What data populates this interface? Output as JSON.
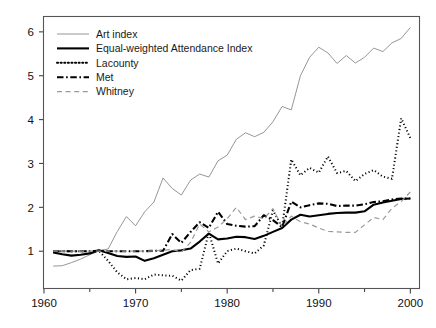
{
  "chart_data": {
    "type": "line",
    "title": "",
    "subtitle": "",
    "xlabel": "",
    "ylabel": "",
    "xlim": [
      1960,
      2001
    ],
    "ylim": [
      0.15,
      6.35
    ],
    "grid": false,
    "legend_position": "top-left",
    "x_ticks": [
      1960,
      1970,
      1980,
      1990,
      2000
    ],
    "x_tick_labels": [
      "1960",
      "1970",
      "1980",
      "1990",
      "2000"
    ],
    "x_minor_ticks": [
      1965,
      1975,
      1985,
      1995
    ],
    "y_ticks": [
      1,
      2,
      3,
      4,
      5,
      6
    ],
    "y_tick_labels": [
      "1",
      "2",
      "3",
      "4",
      "5",
      "6"
    ],
    "x": [
      1961,
      1962,
      1963,
      1964,
      1965,
      1966,
      1967,
      1968,
      1969,
      1970,
      1971,
      1972,
      1973,
      1974,
      1975,
      1976,
      1977,
      1978,
      1979,
      1980,
      1981,
      1982,
      1983,
      1984,
      1985,
      1986,
      1987,
      1988,
      1989,
      1990,
      1991,
      1992,
      1993,
      1994,
      1995,
      1996,
      1997,
      1998,
      1999,
      2000
    ],
    "series": [
      {
        "name": "Art index",
        "style": "solid",
        "color": "#8a8a8a",
        "width": 0.9,
        "values": [
          0.66,
          0.67,
          0.74,
          0.82,
          0.92,
          1.01,
          1.05,
          1.45,
          1.79,
          1.58,
          1.9,
          2.12,
          2.67,
          2.43,
          2.28,
          2.62,
          2.76,
          2.69,
          3.06,
          3.19,
          3.55,
          3.7,
          3.61,
          3.71,
          3.95,
          4.3,
          4.22,
          5.0,
          5.42,
          5.65,
          5.52,
          5.28,
          5.46,
          5.29,
          5.42,
          5.63,
          5.55,
          5.75,
          5.85,
          6.1
        ]
      },
      {
        "name": "Equal-weighted Attendance Index",
        "style": "solid",
        "color": "#000000",
        "width": 2.1,
        "values": [
          0.97,
          0.93,
          0.9,
          0.92,
          0.95,
          1.02,
          0.96,
          0.89,
          0.87,
          0.88,
          0.78,
          0.84,
          0.92,
          1.0,
          1.02,
          1.06,
          1.22,
          1.4,
          1.27,
          1.29,
          1.33,
          1.32,
          1.28,
          1.35,
          1.44,
          1.53,
          1.72,
          1.83,
          1.79,
          1.82,
          1.85,
          1.87,
          1.88,
          1.88,
          1.91,
          2.06,
          2.11,
          2.15,
          2.19,
          2.2
        ]
      },
      {
        "name": "Lacounty",
        "style": "dotted",
        "color": "#000000",
        "width": 2.0,
        "values": [
          0.99,
          1.0,
          1.0,
          1.0,
          1.0,
          1.01,
          0.78,
          0.52,
          0.36,
          0.39,
          0.36,
          0.47,
          0.45,
          0.44,
          0.33,
          0.57,
          0.6,
          1.43,
          0.72,
          1.0,
          1.06,
          1.0,
          0.95,
          1.13,
          1.93,
          1.55,
          3.09,
          2.73,
          2.9,
          2.79,
          3.16,
          2.78,
          2.83,
          2.6,
          2.76,
          2.85,
          2.7,
          2.65,
          4.03,
          3.58
        ]
      },
      {
        "name": "Met",
        "style": "dashdot",
        "color": "#000000",
        "width": 2.1,
        "values": [
          1.0,
          1.0,
          1.0,
          1.0,
          1.0,
          1.01,
          1.0,
          1.0,
          1.0,
          1.0,
          1.0,
          1.01,
          1.01,
          1.39,
          1.19,
          1.44,
          1.66,
          1.53,
          1.9,
          1.62,
          1.58,
          1.56,
          1.57,
          1.82,
          1.71,
          1.55,
          2.13,
          2.0,
          2.05,
          2.09,
          2.08,
          2.03,
          2.04,
          2.04,
          2.07,
          2.12,
          2.14,
          2.18,
          2.2,
          2.2
        ]
      },
      {
        "name": "Whitney",
        "style": "dashed",
        "color": "#9a9a9a",
        "width": 1.2,
        "values": [
          1.0,
          1.0,
          1.0,
          1.0,
          1.0,
          1.0,
          1.0,
          1.0,
          1.0,
          1.0,
          1.0,
          1.01,
          1.02,
          1.04,
          0.98,
          1.2,
          1.62,
          1.44,
          1.55,
          1.74,
          2.0,
          1.72,
          1.8,
          1.74,
          1.97,
          1.55,
          1.8,
          1.67,
          1.62,
          1.53,
          1.45,
          1.44,
          1.43,
          1.43,
          1.6,
          1.77,
          1.72,
          1.98,
          2.13,
          2.35
        ]
      }
    ]
  },
  "legend": {
    "entries": [
      {
        "label": "Art index"
      },
      {
        "label": "Equal-weighted Attendance Index"
      },
      {
        "label": "Lacounty"
      },
      {
        "label": "Met"
      },
      {
        "label": "Whitney"
      }
    ]
  },
  "axes": {
    "x_tick_labels": [
      "1960",
      "1970",
      "1980",
      "1990",
      "2000"
    ],
    "y_tick_labels": [
      "1",
      "2",
      "3",
      "4",
      "5",
      "6"
    ]
  },
  "colors": {
    "art_index": "#8a8a8a",
    "equal_weighted": "#000000",
    "lacounty": "#000000",
    "met": "#000000",
    "whitney": "#9a9a9a",
    "frame": "#555555",
    "background": "#ffffff"
  }
}
